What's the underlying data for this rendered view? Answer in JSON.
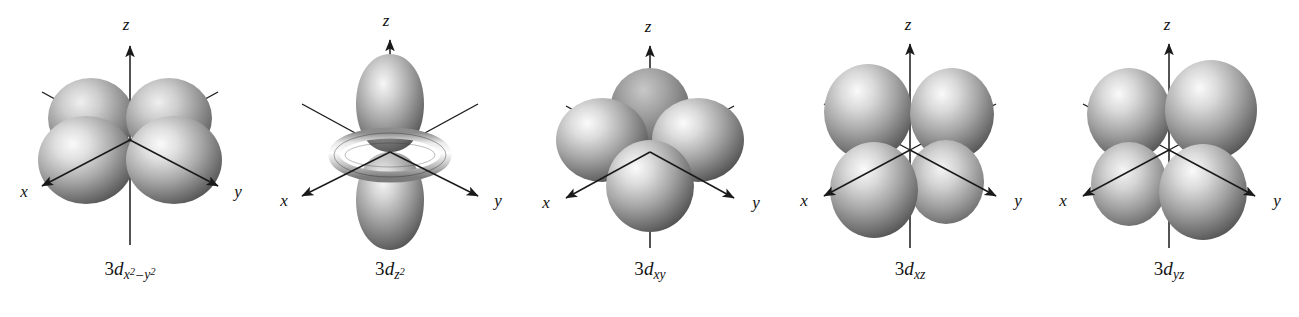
{
  "figure": {
    "name": "3d orbital shapes",
    "background_color": "#ffffff",
    "line_color": "#1a1a1a",
    "lobe_light_color": "#f2f2f2",
    "lobe_mid_color": "#a8a8a8",
    "lobe_dark_color": "#4a4a4a",
    "lobe_back_color": "#6d6d6d",
    "width": 1299,
    "height": 317
  },
  "axes": {
    "x_label": "x",
    "y_label": "y",
    "z_label": "z"
  },
  "orbitals": [
    {
      "id": "3d-x2-y2",
      "type": "dx2-y2",
      "base": "3d",
      "base_digit": "3",
      "base_letter": "d",
      "subscript_plain": "x2 - y2",
      "sub_first_var": "x",
      "sub_first_exp": "2",
      "sub_operator": "–",
      "sub_second_var": "y",
      "sub_second_exp": "2",
      "label_text": "3dx2 – y2",
      "lobe_count": 4,
      "lobe_orientation": "along x and y axes",
      "has_torus": false,
      "left": 0
    },
    {
      "id": "3d-z2",
      "type": "dz2",
      "base": "3d",
      "base_digit": "3",
      "base_letter": "d",
      "subscript_plain": "z2",
      "sub_first_var": "z",
      "sub_first_exp": "2",
      "sub_operator": "",
      "sub_second_var": "",
      "sub_second_exp": "",
      "label_text": "3dz2",
      "lobe_count": 2,
      "lobe_orientation": "along z axis with equatorial torus",
      "has_torus": true,
      "left": 260
    },
    {
      "id": "3d-xy",
      "type": "dxy",
      "base": "3d",
      "base_digit": "3",
      "base_letter": "d",
      "subscript_plain": "xy",
      "sub_first_var": "x",
      "sub_first_exp": "",
      "sub_operator": "",
      "sub_second_var": "y",
      "sub_second_exp": "",
      "label_text": "3dxy",
      "lobe_count": 4,
      "lobe_orientation": "between x and y axes in xy plane",
      "has_torus": false,
      "left": 520
    },
    {
      "id": "3d-xz",
      "type": "dxz",
      "base": "3d",
      "base_digit": "3",
      "base_letter": "d",
      "subscript_plain": "xz",
      "sub_first_var": "x",
      "sub_first_exp": "",
      "sub_operator": "",
      "sub_second_var": "z",
      "sub_second_exp": "",
      "label_text": "3dxz",
      "lobe_count": 4,
      "lobe_orientation": "between x and z axes in xz plane",
      "has_torus": false,
      "left": 780
    },
    {
      "id": "3d-yz",
      "type": "dyz",
      "base": "3d",
      "base_digit": "3",
      "base_letter": "d",
      "subscript_plain": "yz",
      "sub_first_var": "y",
      "sub_first_exp": "",
      "sub_operator": "",
      "sub_second_var": "z",
      "sub_second_exp": "",
      "label_text": "3dyz",
      "lobe_count": 4,
      "lobe_orientation": "between y and z axes in yz plane",
      "has_torus": false,
      "left": 1039
    }
  ]
}
